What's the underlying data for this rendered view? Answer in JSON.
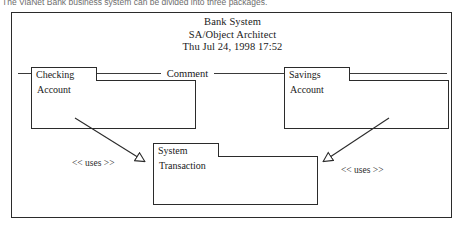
{
  "caption": {
    "text": "The ViaNet Bank business system can be divided into three packages."
  },
  "frame": {
    "title_block": {
      "line1": "Bank System",
      "line2": "SA/Object Architect",
      "line3": "Thu Jul 24, 1998  17:52"
    },
    "comment_group": {
      "label": "Comment"
    },
    "packages": [
      {
        "id": "checking",
        "tab_label": "Checking",
        "body_label": "Account"
      },
      {
        "id": "savings",
        "tab_label": "Savings",
        "body_label": "Account"
      },
      {
        "id": "system",
        "tab_label": "System",
        "body_label": "Transaction"
      }
    ],
    "dependencies": [
      {
        "id": "checking-to-system",
        "stereotype": "<< uses >>",
        "from": "checking",
        "to": "system",
        "arrowhead": "hollow-triangle"
      },
      {
        "id": "savings-to-system",
        "stereotype": "<< uses >>",
        "from": "savings",
        "to": "system",
        "arrowhead": "hollow-triangle"
      }
    ]
  },
  "colors": {
    "line": "#2b2b2b",
    "text": "#1a1a1a",
    "caption_text": "#6d6d6d",
    "background": "#ffffff"
  }
}
